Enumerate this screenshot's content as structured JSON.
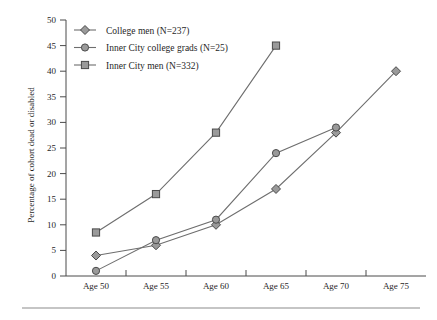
{
  "chart_data": {
    "type": "line",
    "title": "",
    "xlabel": "",
    "ylabel": "Percentage of cohort dead or disabled",
    "categories": [
      "Age 50",
      "Age 55",
      "Age 60",
      "Age 65",
      "Age 70",
      "Age 75"
    ],
    "x": [
      50,
      55,
      60,
      65,
      70,
      75
    ],
    "ylim": [
      0,
      50
    ],
    "yticks": [
      0,
      5,
      10,
      15,
      20,
      25,
      30,
      35,
      40,
      45,
      50
    ],
    "ytick_labels": [
      "0",
      "5",
      "10",
      "15",
      "20",
      "25",
      "30",
      "35",
      "40",
      "45",
      "50"
    ],
    "grid": false,
    "legend_position": "top-left",
    "series": [
      {
        "name": "College men (N=237)",
        "marker": "diamond",
        "values": [
          4,
          6,
          10,
          17,
          28,
          40
        ]
      },
      {
        "name": "Inner City college grads (N=25)",
        "marker": "circle",
        "values": [
          1,
          7,
          11,
          24,
          29,
          null
        ]
      },
      {
        "name": "Inner City men (N=332)",
        "marker": "square",
        "values": [
          8.5,
          16,
          28,
          45,
          null,
          null
        ]
      }
    ],
    "colors": {
      "line": "#6e6e6e",
      "marker_fill": "#9a9a9a",
      "marker_stroke": "#4a4a4a",
      "axis": "#4a4a4a",
      "text": "#1f1f1f"
    }
  },
  "legend": {
    "items": [
      {
        "label": "College men (N=237)",
        "marker": "diamond"
      },
      {
        "label": "Inner City college grads (N=25)",
        "marker": "circle"
      },
      {
        "label": "Inner City men (N=332)",
        "marker": "square"
      }
    ]
  },
  "axes": {
    "y_title": "Percentage of cohort dead or disabled",
    "y_labels": [
      "50",
      "45",
      "40",
      "35",
      "30",
      "25",
      "20",
      "15",
      "10",
      "5",
      "0"
    ],
    "x_labels": [
      "Age 50",
      "Age 55",
      "Age 60",
      "Age 65",
      "Age 70",
      "Age 75"
    ]
  }
}
